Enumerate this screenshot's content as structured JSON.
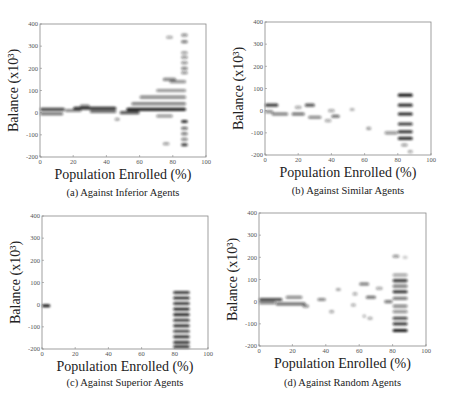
{
  "figure": {
    "panels": [
      {
        "caption": "(a) Against Inferior Agents"
      },
      {
        "caption": "(b) Against Similar Agents"
      },
      {
        "caption": "(c) Against Superior Agents"
      },
      {
        "caption": "(d) Against Random Agents"
      }
    ]
  },
  "chart_data": [
    {
      "type": "heatmap",
      "title": "(a) Against Inferior Agents",
      "xlabel": "Population Enrolled (%)",
      "ylabel": "Balance (x10³)",
      "xlim": [
        0,
        100
      ],
      "ylim": [
        -200,
        400
      ],
      "xticks": [
        0,
        20,
        40,
        60,
        80,
        100
      ],
      "yticks": [
        -200,
        -100,
        0,
        100,
        200,
        300,
        400
      ],
      "grid": false,
      "blobs": [
        {
          "x0": 0,
          "x1": 15,
          "y": 15,
          "w": 0.75
        },
        {
          "x0": 0,
          "x1": 14,
          "y": -5,
          "w": 0.6
        },
        {
          "x0": 15,
          "x1": 25,
          "y": 10,
          "w": 0.5
        },
        {
          "x0": 20,
          "x1": 46,
          "y": 20,
          "w": 0.85
        },
        {
          "x0": 24,
          "x1": 30,
          "y": 30,
          "w": 0.5
        },
        {
          "x0": 30,
          "x1": 46,
          "y": 5,
          "w": 0.6
        },
        {
          "x0": 45,
          "x1": 48,
          "y": -30,
          "w": 0.4
        },
        {
          "x0": 48,
          "x1": 60,
          "y": 0,
          "w": 0.7
        },
        {
          "x0": 52,
          "x1": 88,
          "y": 15,
          "w": 0.9
        },
        {
          "x0": 55,
          "x1": 88,
          "y": 40,
          "w": 0.55
        },
        {
          "x0": 60,
          "x1": 88,
          "y": 70,
          "w": 0.5
        },
        {
          "x0": 70,
          "x1": 88,
          "y": 100,
          "w": 0.45
        },
        {
          "x0": 74,
          "x1": 82,
          "y": 150,
          "w": 0.5
        },
        {
          "x0": 78,
          "x1": 88,
          "y": 140,
          "w": 0.45
        },
        {
          "x0": 70,
          "x1": 80,
          "y": -15,
          "w": 0.45
        },
        {
          "x0": 74,
          "x1": 78,
          "y": -140,
          "w": 0.4
        },
        {
          "x0": 76,
          "x1": 80,
          "y": 340,
          "w": 0.35
        },
        {
          "x0": 85,
          "x1": 89,
          "y": 350,
          "w": 0.45
        },
        {
          "x0": 85,
          "x1": 89,
          "y": 320,
          "w": 0.55
        },
        {
          "x0": 85,
          "x1": 89,
          "y": 270,
          "w": 0.4
        },
        {
          "x0": 85,
          "x1": 89,
          "y": 250,
          "w": 0.45
        },
        {
          "x0": 85,
          "x1": 89,
          "y": 225,
          "w": 0.45
        },
        {
          "x0": 85,
          "x1": 89,
          "y": 200,
          "w": 0.5
        },
        {
          "x0": 85,
          "x1": 89,
          "y": 180,
          "w": 0.45
        },
        {
          "x0": 85,
          "x1": 89,
          "y": -40,
          "w": 0.85
        },
        {
          "x0": 85,
          "x1": 89,
          "y": -70,
          "w": 0.6
        },
        {
          "x0": 85,
          "x1": 89,
          "y": -95,
          "w": 0.55
        },
        {
          "x0": 85,
          "x1": 89,
          "y": -120,
          "w": 0.5
        },
        {
          "x0": 85,
          "x1": 89,
          "y": -145,
          "w": 0.8
        }
      ]
    },
    {
      "type": "heatmap",
      "title": "(b) Against Similar Agents",
      "xlabel": "Population Enrolled (%)",
      "ylabel": "Balance (x10³)",
      "xlim": [
        0,
        100
      ],
      "ylim": [
        -200,
        400
      ],
      "xticks": [
        0,
        20,
        40,
        60,
        80,
        100
      ],
      "yticks": [
        -200,
        -100,
        0,
        100,
        200,
        300,
        400
      ],
      "grid": false,
      "blobs": [
        {
          "x0": 0,
          "x1": 8,
          "y": 25,
          "w": 0.8
        },
        {
          "x0": 0,
          "x1": 5,
          "y": -5,
          "w": 0.5
        },
        {
          "x0": 4,
          "x1": 14,
          "y": -15,
          "w": 0.55
        },
        {
          "x0": 16,
          "x1": 24,
          "y": -15,
          "w": 0.6
        },
        {
          "x0": 18,
          "x1": 22,
          "y": 15,
          "w": 0.35
        },
        {
          "x0": 24,
          "x1": 30,
          "y": 25,
          "w": 0.7
        },
        {
          "x0": 26,
          "x1": 34,
          "y": -30,
          "w": 0.5
        },
        {
          "x0": 36,
          "x1": 40,
          "y": -45,
          "w": 0.35
        },
        {
          "x0": 38,
          "x1": 42,
          "y": 0,
          "w": 0.35
        },
        {
          "x0": 40,
          "x1": 45,
          "y": -25,
          "w": 0.6
        },
        {
          "x0": 51,
          "x1": 54,
          "y": 5,
          "w": 0.3
        },
        {
          "x0": 61,
          "x1": 64,
          "y": -80,
          "w": 0.4
        },
        {
          "x0": 72,
          "x1": 80,
          "y": -100,
          "w": 0.45
        },
        {
          "x0": 80,
          "x1": 89,
          "y": 70,
          "w": 0.95
        },
        {
          "x0": 80,
          "x1": 89,
          "y": 25,
          "w": 0.85
        },
        {
          "x0": 80,
          "x1": 89,
          "y": -15,
          "w": 0.9
        },
        {
          "x0": 80,
          "x1": 89,
          "y": -60,
          "w": 0.8
        },
        {
          "x0": 80,
          "x1": 89,
          "y": -95,
          "w": 0.85
        },
        {
          "x0": 80,
          "x1": 89,
          "y": -125,
          "w": 0.85
        },
        {
          "x0": 82,
          "x1": 86,
          "y": -155,
          "w": 0.4
        },
        {
          "x0": 86,
          "x1": 89,
          "y": -185,
          "w": 0.35
        }
      ]
    },
    {
      "type": "heatmap",
      "title": "(c) Against Superior Agents",
      "xlabel": "Population Enrolled (%)",
      "ylabel": "Balance (x10³)",
      "xlim": [
        0,
        100
      ],
      "ylim": [
        -200,
        400
      ],
      "xticks": [
        0,
        20,
        40,
        60,
        80,
        100
      ],
      "yticks": [
        -200,
        -100,
        0,
        100,
        200,
        300,
        400
      ],
      "grid": false,
      "blobs": [
        {
          "x0": 0,
          "x1": 5,
          "y": -5,
          "w": 0.95
        },
        {
          "x0": 79,
          "x1": 89,
          "y": 55,
          "w": 0.8
        },
        {
          "x0": 79,
          "x1": 89,
          "y": 30,
          "w": 0.85
        },
        {
          "x0": 79,
          "x1": 89,
          "y": 5,
          "w": 0.8
        },
        {
          "x0": 79,
          "x1": 89,
          "y": -20,
          "w": 0.85
        },
        {
          "x0": 79,
          "x1": 89,
          "y": -45,
          "w": 0.85
        },
        {
          "x0": 79,
          "x1": 89,
          "y": -70,
          "w": 0.8
        },
        {
          "x0": 79,
          "x1": 89,
          "y": -95,
          "w": 0.85
        },
        {
          "x0": 79,
          "x1": 89,
          "y": -120,
          "w": 0.75
        },
        {
          "x0": 79,
          "x1": 89,
          "y": -145,
          "w": 0.85
        },
        {
          "x0": 79,
          "x1": 89,
          "y": -170,
          "w": 0.8
        },
        {
          "x0": 79,
          "x1": 89,
          "y": -190,
          "w": 0.85
        }
      ]
    },
    {
      "type": "heatmap",
      "title": "(d) Against Random Agents",
      "xlabel": "Population Enrolled (%)",
      "ylabel": "Balance (x10³)",
      "xlim": [
        0,
        100
      ],
      "ylim": [
        -200,
        400
      ],
      "xticks": [
        0,
        20,
        40,
        60,
        80,
        100
      ],
      "yticks": [
        -200,
        -100,
        0,
        100,
        200,
        300,
        400
      ],
      "grid": false,
      "blobs": [
        {
          "x0": 0,
          "x1": 14,
          "y": 10,
          "w": 0.75
        },
        {
          "x0": 0,
          "x1": 10,
          "y": -5,
          "w": 0.55
        },
        {
          "x0": 10,
          "x1": 28,
          "y": -10,
          "w": 0.6
        },
        {
          "x0": 16,
          "x1": 26,
          "y": 20,
          "w": 0.5
        },
        {
          "x0": 26,
          "x1": 30,
          "y": -20,
          "w": 0.45
        },
        {
          "x0": 35,
          "x1": 40,
          "y": 10,
          "w": 0.5
        },
        {
          "x0": 42,
          "x1": 45,
          "y": -45,
          "w": 0.35
        },
        {
          "x0": 46,
          "x1": 49,
          "y": 55,
          "w": 0.35
        },
        {
          "x0": 55,
          "x1": 58,
          "y": -15,
          "w": 0.35
        },
        {
          "x0": 56,
          "x1": 59,
          "y": 35,
          "w": 0.35
        },
        {
          "x0": 60,
          "x1": 66,
          "y": 80,
          "w": 0.55
        },
        {
          "x0": 62,
          "x1": 64,
          "y": -65,
          "w": 0.35
        },
        {
          "x0": 65,
          "x1": 68,
          "y": -75,
          "w": 0.35
        },
        {
          "x0": 64,
          "x1": 70,
          "y": 20,
          "w": 0.6
        },
        {
          "x0": 70,
          "x1": 74,
          "y": 60,
          "w": 0.35
        },
        {
          "x0": 75,
          "x1": 80,
          "y": 0,
          "w": 0.55
        },
        {
          "x0": 80,
          "x1": 84,
          "y": 205,
          "w": 0.45
        },
        {
          "x0": 86,
          "x1": 89,
          "y": 200,
          "w": 0.2
        },
        {
          "x0": 80,
          "x1": 89,
          "y": 120,
          "w": 0.4
        },
        {
          "x0": 80,
          "x1": 89,
          "y": 95,
          "w": 0.8
        },
        {
          "x0": 80,
          "x1": 89,
          "y": 70,
          "w": 0.55
        },
        {
          "x0": 80,
          "x1": 89,
          "y": 45,
          "w": 0.85
        },
        {
          "x0": 80,
          "x1": 89,
          "y": 15,
          "w": 0.55
        },
        {
          "x0": 80,
          "x1": 89,
          "y": -20,
          "w": 0.5
        },
        {
          "x0": 80,
          "x1": 89,
          "y": -45,
          "w": 0.45
        },
        {
          "x0": 80,
          "x1": 89,
          "y": -75,
          "w": 0.75
        },
        {
          "x0": 80,
          "x1": 89,
          "y": -100,
          "w": 0.8
        },
        {
          "x0": 80,
          "x1": 89,
          "y": -130,
          "w": 0.95
        }
      ]
    }
  ]
}
